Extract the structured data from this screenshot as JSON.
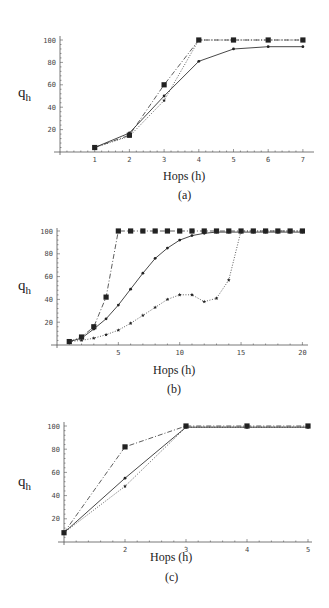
{
  "chart_data": [
    {
      "type": "line",
      "title": "",
      "caption": "(a)",
      "xlabel": "Hops (h)",
      "ylabel": "q",
      "ylabel_sub": "h",
      "x": [
        1,
        2,
        3,
        4,
        5,
        6,
        7
      ],
      "xticks": [
        1,
        2,
        3,
        4,
        5,
        6,
        7
      ],
      "yticks": [
        20,
        40,
        60,
        80,
        100
      ],
      "xlim": [
        0,
        7.1
      ],
      "ylim": [
        0,
        100
      ],
      "grid": false,
      "legend": null,
      "series": [
        {
          "name": "squares (dash-dot)",
          "marker": "square",
          "style": "dashdot",
          "values": [
            4,
            15,
            60,
            100,
            100,
            100,
            100
          ]
        },
        {
          "name": "dots (solid)",
          "marker": "dot",
          "style": "solid",
          "values": [
            4,
            17,
            50,
            81,
            92,
            94,
            94
          ]
        },
        {
          "name": "stars (dotted)",
          "marker": "star",
          "style": "dotted",
          "values": [
            4,
            14,
            46,
            100,
            100,
            100,
            100
          ]
        }
      ]
    },
    {
      "type": "line",
      "title": "",
      "caption": "(b)",
      "xlabel": "Hops (h)",
      "ylabel": "q",
      "ylabel_sub": "h",
      "x": [
        1,
        2,
        3,
        4,
        5,
        6,
        7,
        8,
        9,
        10,
        11,
        12,
        13,
        14,
        15,
        16,
        17,
        18,
        19,
        20
      ],
      "xticks": [
        5,
        10,
        15,
        20
      ],
      "yticks": [
        20,
        40,
        60,
        80,
        100
      ],
      "xlim": [
        0,
        20.3
      ],
      "ylim": [
        0,
        100
      ],
      "grid": false,
      "legend": null,
      "series": [
        {
          "name": "squares (dash-dot)",
          "marker": "square",
          "style": "dashdot",
          "values": [
            3,
            7,
            16,
            42,
            100,
            100,
            100,
            100,
            100,
            100,
            100,
            100,
            100,
            100,
            100,
            100,
            100,
            100,
            100,
            100
          ]
        },
        {
          "name": "dots (solid)",
          "marker": "dot",
          "style": "solid",
          "values": [
            3,
            6,
            14,
            23,
            35,
            49,
            63,
            76,
            85,
            92,
            96,
            98,
            99,
            99,
            99,
            99,
            99,
            99,
            99,
            99
          ]
        },
        {
          "name": "stars (dotted)",
          "marker": "star",
          "style": "dotted",
          "values": [
            3,
            4,
            6,
            9,
            13,
            19,
            26,
            33,
            40,
            44,
            44,
            38,
            41,
            57,
            100,
            100,
            100,
            100,
            100,
            100
          ]
        }
      ]
    },
    {
      "type": "line",
      "title": "",
      "caption": "(c)",
      "xlabel": "Hops (h)",
      "ylabel": "q",
      "ylabel_sub": "h",
      "x": [
        1,
        2,
        3,
        4,
        5
      ],
      "xticks": [
        2,
        3,
        4,
        5
      ],
      "yticks": [
        20,
        40,
        60,
        80,
        100
      ],
      "xlim": [
        1,
        5.05
      ],
      "ylim": [
        0,
        100
      ],
      "grid": false,
      "legend": null,
      "series": [
        {
          "name": "squares (dash-dot)",
          "marker": "square",
          "style": "dashdot",
          "values": [
            8,
            82,
            100,
            100,
            100
          ]
        },
        {
          "name": "dots (solid)",
          "marker": "dot",
          "style": "solid",
          "values": [
            8,
            55,
            99,
            99,
            99
          ]
        },
        {
          "name": "stars (dotted)",
          "marker": "star",
          "style": "dotted",
          "values": [
            8,
            48,
            99,
            99,
            99
          ]
        }
      ]
    }
  ],
  "charts": [
    {
      "caption": "(a)",
      "xlabel": "Hops (h)",
      "ylabel": "q",
      "ylabel_sub": "h"
    },
    {
      "caption": "(b)",
      "xlabel": "Hops (h)",
      "ylabel": "q",
      "ylabel_sub": "h"
    },
    {
      "caption": "(c)",
      "xlabel": "Hops (h)",
      "ylabel": "q",
      "ylabel_sub": "h"
    }
  ],
  "colors": {
    "line": "#333333",
    "axis": "#555555",
    "marker": "#222222"
  }
}
